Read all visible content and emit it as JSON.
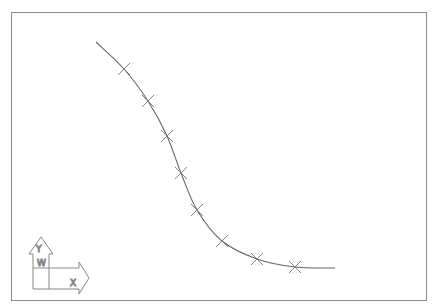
{
  "drawing": {
    "type": "cad-viewport",
    "curve": {
      "name": "spline",
      "color": "#666666",
      "points": [
        [
          96,
          42
        ],
        [
          124,
          69
        ],
        [
          148,
          101
        ],
        [
          167,
          136
        ],
        [
          181,
          173
        ],
        [
          197,
          210
        ],
        [
          222,
          241
        ],
        [
          257,
          259
        ],
        [
          295,
          267
        ],
        [
          335,
          268
        ]
      ]
    },
    "markers": {
      "color": "#777777",
      "points": [
        [
          124,
          69
        ],
        [
          148,
          101
        ],
        [
          167,
          136
        ],
        [
          181,
          173
        ],
        [
          197,
          210
        ],
        [
          222,
          241
        ],
        [
          257,
          259
        ],
        [
          295,
          267
        ]
      ]
    },
    "ucs_icon": {
      "y_label": "Y",
      "x_label": "X",
      "w_label": "W"
    }
  }
}
